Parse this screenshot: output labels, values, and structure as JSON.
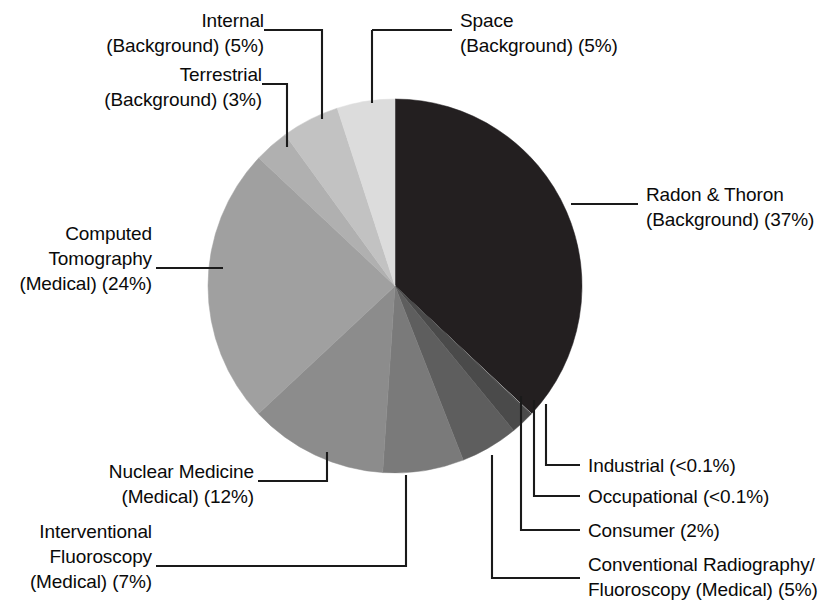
{
  "chart_data": {
    "type": "pie",
    "title": "",
    "subtitle": "",
    "xlabel": "",
    "ylabel": "",
    "units": "percent of total effective dose",
    "legend_position": "callout-labels",
    "grid": false,
    "start_angle_deg": 0,
    "direction": "clockwise",
    "categories": [
      "Radon & Thoron (Background)",
      "Industrial",
      "Occupational",
      "Consumer",
      "Conventional Radiography/Fluoroscopy (Medical)",
      "Interventional Fluoroscopy (Medical)",
      "Nuclear Medicine (Medical)",
      "Computed Tomography (Medical)",
      "Terrestrial (Background)",
      "Internal (Background)",
      "Space (Background)"
    ],
    "values": [
      37,
      0.05,
      0.05,
      2,
      5,
      7,
      12,
      24,
      3,
      5,
      5
    ],
    "value_labels": [
      "37%",
      "<0.1%",
      "<0.1%",
      "2%",
      "5%",
      "7%",
      "12%",
      "24%",
      "3%",
      "5%",
      "5%"
    ],
    "colors": [
      "#231f20",
      "#c9c9c9",
      "#2f2f2f",
      "#4a4a4a",
      "#5e5e5e",
      "#7a7a7a",
      "#8c8c8c",
      "#a0a0a0",
      "#b0b0b0",
      "#c2c2c2",
      "#dcdcdc"
    ],
    "slices": [
      {
        "name": "Radon & Thoron (Background)",
        "value": 37,
        "value_label": "37%",
        "color": "#231f20"
      },
      {
        "name": "Industrial",
        "value": 0.05,
        "value_label": "<0.1%",
        "color": "#c9c9c9"
      },
      {
        "name": "Occupational",
        "value": 0.05,
        "value_label": "<0.1%",
        "color": "#2f2f2f"
      },
      {
        "name": "Consumer",
        "value": 2,
        "value_label": "2%",
        "color": "#4a4a4a"
      },
      {
        "name": "Conventional Radiography/Fluoroscopy (Medical)",
        "value": 5,
        "value_label": "5%",
        "color": "#5e5e5e"
      },
      {
        "name": "Interventional Fluoroscopy (Medical)",
        "value": 7,
        "value_label": "7%",
        "color": "#7a7a7a"
      },
      {
        "name": "Nuclear Medicine (Medical)",
        "value": 12,
        "value_label": "12%",
        "color": "#8c8c8c"
      },
      {
        "name": "Computed Tomography (Medical)",
        "value": 24,
        "value_label": "24%",
        "color": "#a0a0a0"
      },
      {
        "name": "Terrestrial (Background)",
        "value": 3,
        "value_label": "3%",
        "color": "#b0b0b0"
      },
      {
        "name": "Internal (Background)",
        "value": 5,
        "value_label": "5%",
        "color": "#c2c2c2"
      },
      {
        "name": "Space (Background)",
        "value": 5,
        "value_label": "5%",
        "color": "#dcdcdc"
      }
    ]
  },
  "labels": {
    "internal": {
      "line1": "Internal",
      "line2": "(Background) (5%)"
    },
    "terrestrial": {
      "line1": "Terrestrial",
      "line2": "(Background) (3%)"
    },
    "space": {
      "line1": "Space",
      "line2": "(Background) (5%)"
    },
    "radon_thoron": {
      "line1": "Radon & Thoron",
      "line2": "(Background) (37%)"
    },
    "computed_tomography": {
      "line1": "Computed",
      "line2": "Tomography",
      "line3": "(Medical) (24%)"
    },
    "nuclear_medicine": {
      "line1": "Nuclear Medicine",
      "line2": "(Medical) (12%)"
    },
    "interventional_fluoroscopy": {
      "line1": "Interventional",
      "line2": "Fluoroscopy",
      "line3": "(Medical) (7%)"
    },
    "industrial": {
      "line1": "Industrial (<0.1%)"
    },
    "occupational": {
      "line1": "Occupational (<0.1%)"
    },
    "consumer": {
      "line1": "Consumer (2%)"
    },
    "conventional_radiography": {
      "line1": "Conventional Radiography/",
      "line2": "Fluoroscopy (Medical) (5%)"
    }
  },
  "style": {
    "background": "#ffffff",
    "leader_color": "#1a1a1a",
    "text_color": "#0a0a0a"
  }
}
